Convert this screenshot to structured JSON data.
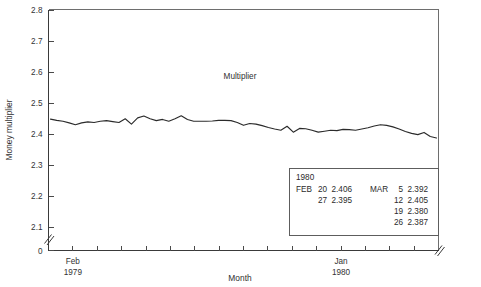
{
  "chart_data": {
    "type": "line",
    "title": "",
    "xlabel": "Month",
    "ylabel": "Money multiplier",
    "series_annotation": "Multiplier",
    "ylim": [
      2.05,
      2.8
    ],
    "grid": false,
    "legend_position": "none",
    "y_axis_break": true,
    "x_axis_break": true,
    "y_ticks": [
      "0",
      "2.1",
      "2.2",
      "2.3",
      "2.4",
      "2.5",
      "2.6",
      "2.7",
      "2.8"
    ],
    "x_tick_labels": [
      {
        "index": 1,
        "line1": "Feb",
        "line2": "1979"
      },
      {
        "index": 12,
        "line1": "Jan",
        "line2": "1980"
      }
    ],
    "x_tick_count": 16,
    "series": [
      {
        "name": "Multiplier",
        "values": [
          2.448,
          2.444,
          2.441,
          2.436,
          2.43,
          2.436,
          2.439,
          2.437,
          2.441,
          2.443,
          2.44,
          2.437,
          2.449,
          2.432,
          2.452,
          2.458,
          2.449,
          2.443,
          2.447,
          2.441,
          2.449,
          2.459,
          2.447,
          2.441,
          2.441,
          2.441,
          2.442,
          2.444,
          2.444,
          2.443,
          2.437,
          2.428,
          2.434,
          2.432,
          2.427,
          2.421,
          2.416,
          2.412,
          2.425,
          2.406,
          2.418,
          2.417,
          2.412,
          2.406,
          2.409,
          2.412,
          2.411,
          2.415,
          2.414,
          2.412,
          2.416,
          2.42,
          2.426,
          2.43,
          2.428,
          2.423,
          2.416,
          2.408,
          2.402,
          2.398,
          2.405,
          2.392,
          2.387
        ]
      }
    ],
    "data_table": {
      "year": "1980",
      "columns": [
        {
          "month": "FEB",
          "rows": [
            {
              "day": "20",
              "value": "2.406"
            },
            {
              "day": "27",
              "value": "2.395"
            }
          ]
        },
        {
          "month": "MAR",
          "rows": [
            {
              "day": "5",
              "value": "2.392"
            },
            {
              "day": "12",
              "value": "2.405"
            },
            {
              "day": "19",
              "value": "2.380"
            },
            {
              "day": "26",
              "value": "2.387"
            }
          ]
        }
      ]
    },
    "colors": {
      "line": "#2b2b2b",
      "axis": "#3a3a3a",
      "frame": "#6e6e6e",
      "text": "#2f2f2f",
      "background": "#ffffff"
    }
  }
}
